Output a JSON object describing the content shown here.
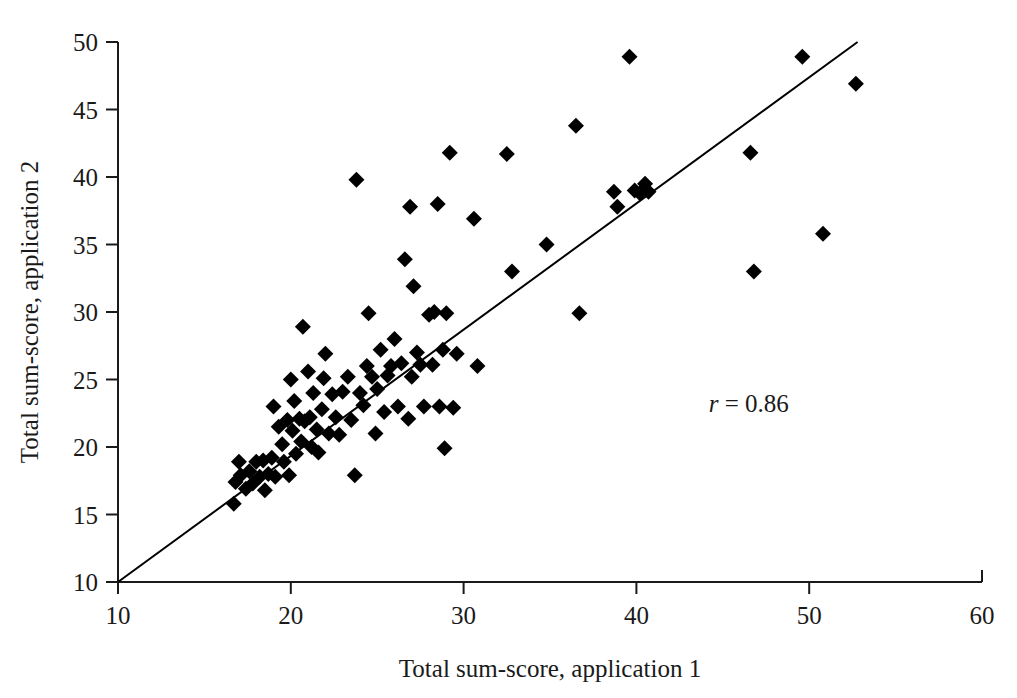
{
  "chart_data": {
    "type": "scatter",
    "title": "",
    "xlabel": "Total sum-score, application 1",
    "ylabel": "Total sum-score, application 2",
    "xlim": [
      10,
      60
    ],
    "ylim": [
      10,
      50
    ],
    "xticks": [
      10,
      20,
      30,
      40,
      50,
      60
    ],
    "yticks": [
      10,
      15,
      20,
      25,
      30,
      35,
      40,
      45,
      50
    ],
    "xtick_labels": [
      "10",
      "20",
      "30",
      "40",
      "50",
      "60"
    ],
    "ytick_labels": [
      "10",
      "15",
      "20",
      "25",
      "30",
      "35",
      "40",
      "45",
      "50"
    ],
    "grid": false,
    "legend": false,
    "marker_shape": "diamond",
    "marker_color": "#000000",
    "marker_size_px": 16,
    "annotations": [
      {
        "name": "correlation",
        "symbol": "r",
        "equals": " = ",
        "value": "0.86",
        "text": "r = 0.86",
        "x": 46.5,
        "y": 22.6
      }
    ],
    "fit_line": {
      "type": "linear",
      "label": "regression line",
      "x0": 10.0,
      "y0": 10.0,
      "x1": 52.8,
      "y1": 50.0,
      "slope": 0.935,
      "intercept": 0.65,
      "color": "#000000",
      "width_px": 2
    },
    "points": [
      [
        16.7,
        15.8
      ],
      [
        16.8,
        17.4
      ],
      [
        17.0,
        18.9
      ],
      [
        17.1,
        17.9
      ],
      [
        17.4,
        16.9
      ],
      [
        17.6,
        18.2
      ],
      [
        17.8,
        17.3
      ],
      [
        18.0,
        18.9
      ],
      [
        18.2,
        17.8
      ],
      [
        18.4,
        19.0
      ],
      [
        18.5,
        16.8
      ],
      [
        18.7,
        18.0
      ],
      [
        18.9,
        19.2
      ],
      [
        19.0,
        23.0
      ],
      [
        19.1,
        17.8
      ],
      [
        19.3,
        21.5
      ],
      [
        19.5,
        20.2
      ],
      [
        19.6,
        18.9
      ],
      [
        19.8,
        22.0
      ],
      [
        19.9,
        17.9
      ],
      [
        20.0,
        25.0
      ],
      [
        20.1,
        21.2
      ],
      [
        20.2,
        23.4
      ],
      [
        20.3,
        19.5
      ],
      [
        20.5,
        22.1
      ],
      [
        20.6,
        20.4
      ],
      [
        20.7,
        28.9
      ],
      [
        20.8,
        21.9
      ],
      [
        21.0,
        25.6
      ],
      [
        21.1,
        22.2
      ],
      [
        21.2,
        20.0
      ],
      [
        21.3,
        24.0
      ],
      [
        21.5,
        21.3
      ],
      [
        21.6,
        19.6
      ],
      [
        21.8,
        22.8
      ],
      [
        21.9,
        25.1
      ],
      [
        22.0,
        26.9
      ],
      [
        22.2,
        21.0
      ],
      [
        22.4,
        23.9
      ],
      [
        22.6,
        22.2
      ],
      [
        22.8,
        20.9
      ],
      [
        23.0,
        24.1
      ],
      [
        23.3,
        25.2
      ],
      [
        23.5,
        22.0
      ],
      [
        23.7,
        17.9
      ],
      [
        23.8,
        39.8
      ],
      [
        24.0,
        24.0
      ],
      [
        24.2,
        23.1
      ],
      [
        24.4,
        26.0
      ],
      [
        24.5,
        29.9
      ],
      [
        24.7,
        25.2
      ],
      [
        24.9,
        21.0
      ],
      [
        25.0,
        24.3
      ],
      [
        25.2,
        27.2
      ],
      [
        25.4,
        22.6
      ],
      [
        25.6,
        25.3
      ],
      [
        25.8,
        26.0
      ],
      [
        26.0,
        28.0
      ],
      [
        26.2,
        23.0
      ],
      [
        26.4,
        26.2
      ],
      [
        26.6,
        33.9
      ],
      [
        26.8,
        22.1
      ],
      [
        26.9,
        37.8
      ],
      [
        27.0,
        25.2
      ],
      [
        27.1,
        31.9
      ],
      [
        27.3,
        27.0
      ],
      [
        27.5,
        26.1
      ],
      [
        27.7,
        23.0
      ],
      [
        28.0,
        29.8
      ],
      [
        28.2,
        26.1
      ],
      [
        28.3,
        30.0
      ],
      [
        28.5,
        38.0
      ],
      [
        28.6,
        23.0
      ],
      [
        28.8,
        27.2
      ],
      [
        28.9,
        19.9
      ],
      [
        29.0,
        29.9
      ],
      [
        29.2,
        41.8
      ],
      [
        29.4,
        22.9
      ],
      [
        29.6,
        26.9
      ],
      [
        30.6,
        36.9
      ],
      [
        30.8,
        26.0
      ],
      [
        32.5,
        41.7
      ],
      [
        32.8,
        33.0
      ],
      [
        34.8,
        35.0
      ],
      [
        36.5,
        43.8
      ],
      [
        36.7,
        29.9
      ],
      [
        38.7,
        38.9
      ],
      [
        38.9,
        37.8
      ],
      [
        39.6,
        48.9
      ],
      [
        39.9,
        39.0
      ],
      [
        40.2,
        38.8
      ],
      [
        40.5,
        39.5
      ],
      [
        40.7,
        38.9
      ],
      [
        46.6,
        41.8
      ],
      [
        46.8,
        33.0
      ],
      [
        49.6,
        48.9
      ],
      [
        50.8,
        35.8
      ],
      [
        52.7,
        46.9
      ]
    ]
  }
}
